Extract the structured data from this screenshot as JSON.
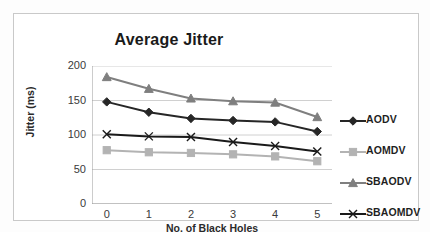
{
  "figure": {
    "border_color": "#c9c9c9",
    "background": "#ffffff"
  },
  "chart_data": {
    "type": "line",
    "title": "Average Jitter",
    "xlabel": "No. of Black Holes",
    "ylabel": "Jitter (ms)",
    "categories": [
      0,
      1,
      2,
      3,
      4,
      5
    ],
    "x_tick_labels": [
      "0",
      "1",
      "2",
      "3",
      "4",
      "5"
    ],
    "y_tick_labels": [
      "0",
      "50",
      "100",
      "150",
      "200"
    ],
    "y_ticks": [
      0,
      50,
      100,
      150,
      200
    ],
    "xlim": [
      -0.35,
      5.35
    ],
    "ylim": [
      0,
      200
    ],
    "grid": "horizontal",
    "legend_position": "right",
    "series": [
      {
        "name": "AODV",
        "color": "#262626",
        "marker": "diamond",
        "values": [
          148,
          133,
          124,
          121,
          119,
          105
        ]
      },
      {
        "name": "AOMDV",
        "color": "#b3b3b3",
        "marker": "square",
        "values": [
          78,
          75,
          74,
          72,
          69,
          62
        ]
      },
      {
        "name": "SBAODV",
        "color": "#7f7f7f",
        "marker": "triangle",
        "values": [
          184,
          167,
          153,
          149,
          147,
          126
        ]
      },
      {
        "name": "SBAOMDV",
        "color": "#1a1a1a",
        "marker": "cross",
        "values": [
          101,
          98,
          97,
          90,
          84,
          76
        ]
      }
    ]
  },
  "legend": {
    "items": [
      {
        "label": "AODV",
        "marker": "diamond-marker-icon",
        "color": "#262626"
      },
      {
        "label": "AOMDV",
        "marker": "square-marker-icon",
        "color": "#b3b3b3"
      },
      {
        "label": "SBAODV",
        "marker": "triangle-marker-icon",
        "color": "#7f7f7f"
      },
      {
        "label": "SBAOMDV",
        "marker": "cross-marker-icon",
        "color": "#1a1a1a"
      }
    ]
  }
}
